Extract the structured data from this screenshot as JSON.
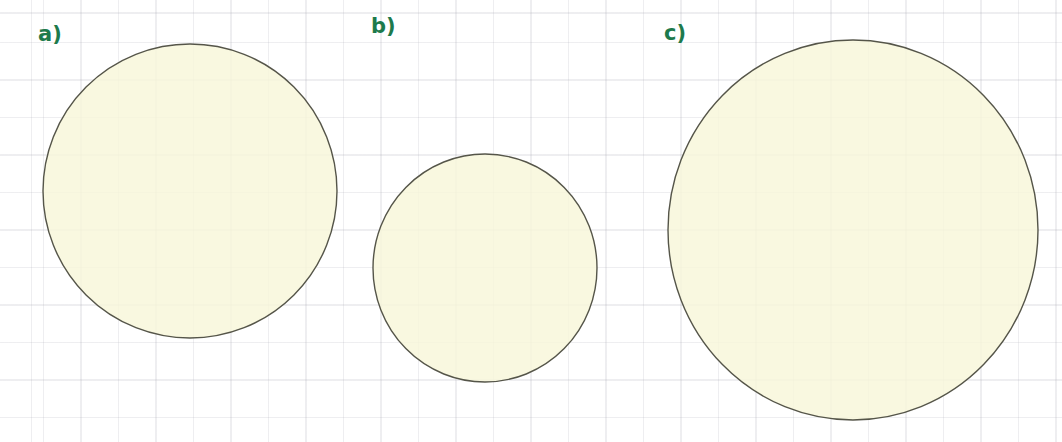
{
  "figure": {
    "width": 1062,
    "height": 442,
    "background_color": "#ffffff",
    "paper": {
      "type": "graph-paper",
      "grid_spacing_px": 37.5,
      "grid_color": "#9696a5",
      "grid_origin_x": 43,
      "grid_origin_y": 42
    },
    "cropped_header_text": "— —— —— —— —",
    "shape_style": {
      "fill_color": "#f8f6d9",
      "stroke_color": "#555549",
      "stroke_width": 1.4
    },
    "label_color": "#1d7a4c"
  },
  "chart_data": {
    "type": "scatter",
    "title": "",
    "subtitle": "",
    "xlabel": "",
    "ylabel": "",
    "grid": true,
    "legend": "none",
    "units": "grid squares (1 square = 37.5 px)",
    "shapes": [
      {
        "label": "a)",
        "shape": "circle",
        "center_x": 190,
        "center_y": 191,
        "radius_x": 147,
        "radius_y": 147,
        "diameter_px": 294,
        "diameter_squares": 7.8,
        "fill": "#f8f6d9",
        "stroke": "#555549"
      },
      {
        "label": "b)",
        "shape": "circle",
        "center_x": 485,
        "center_y": 268,
        "radius_x": 112,
        "radius_y": 114,
        "diameter_px": 226,
        "diameter_squares": 6.0,
        "fill": "#f8f6d9",
        "stroke": "#555549"
      },
      {
        "label": "c)",
        "shape": "circle",
        "center_x": 853,
        "center_y": 230,
        "radius_x": 185,
        "radius_y": 190,
        "diameter_px": 375,
        "diameter_squares": 10.0,
        "fill": "#f8f6d9",
        "stroke": "#555549"
      }
    ]
  },
  "labels": [
    {
      "text": "a)",
      "x": 38,
      "y": 24
    },
    {
      "text": "b)",
      "x": 371,
      "y": 16
    },
    {
      "text": "c)",
      "x": 664,
      "y": 23
    }
  ]
}
